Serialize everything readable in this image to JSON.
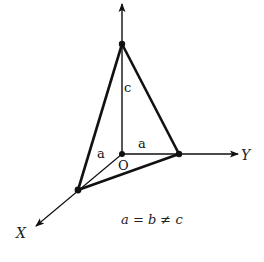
{
  "diagram": {
    "axes": {
      "x_label": "X",
      "y_label": "Y"
    },
    "origin_label": "O",
    "edge_labels": {
      "z_edge": "c",
      "y_edge": "a",
      "x_edge": "a"
    },
    "equation": "a = b ≠ c",
    "colors": {
      "line": "#111111",
      "background": "#ffffff"
    }
  }
}
